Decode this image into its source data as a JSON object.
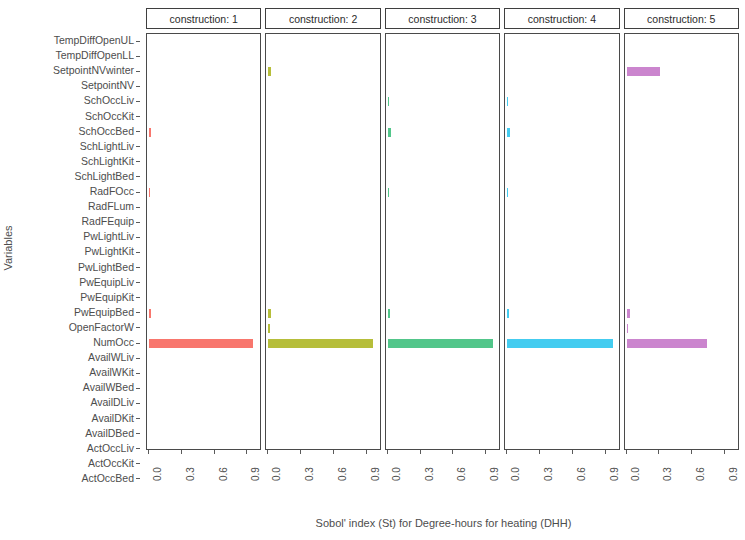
{
  "chart_data": {
    "type": "bar",
    "title": "",
    "xlabel": "Sobol' index (St) for Degree-hours for heating (DHH)",
    "ylabel": "Variables",
    "orientation": "horizontal",
    "facet_variable": "construction",
    "grid": false,
    "legend": "none",
    "xlim": [
      0,
      1.0
    ],
    "xticks": [
      0.0,
      0.3,
      0.6,
      0.9
    ],
    "xticklabels": [
      "0.0",
      "0.3",
      "0.6",
      "0.9"
    ],
    "categories": [
      "TempDiffOpenUL",
      "TempDiffOpenLL",
      "SetpointNVwinter",
      "SetpointNV",
      "SchOccLiv",
      "SchOccKit",
      "SchOccBed",
      "SchLightLiv",
      "SchLightKit",
      "SchLightBed",
      "RadFOcc",
      "RadFLum",
      "RadFEquip",
      "PwLightLiv",
      "PwLightKit",
      "PwLightBed",
      "PwEquipLiv",
      "PwEquipKit",
      "PwEquipBed",
      "OpenFactorW",
      "NumOcc",
      "AvailWLiv",
      "AvailWKit",
      "AvailWBed",
      "AvailDLiv",
      "AvailDKit",
      "AvailDBed",
      "ActOccLiv",
      "ActOccKit",
      "ActOccBed"
    ],
    "panels": [
      {
        "label": "construction: 1",
        "facet_value": "1",
        "color": "#F8766D",
        "values": [
          0,
          0,
          0,
          0,
          0,
          0,
          0.022,
          0,
          0,
          0,
          0.006,
          0,
          0,
          0,
          0,
          0,
          0,
          0,
          0.018,
          0,
          0.95,
          0,
          0,
          0,
          0,
          0,
          0,
          0,
          0,
          0
        ]
      },
      {
        "label": "construction: 2",
        "facet_value": "2",
        "color": "#B6BE3A",
        "values": [
          0,
          0,
          0.026,
          0,
          0,
          0,
          0,
          0,
          0,
          0,
          0,
          0,
          0,
          0,
          0,
          0,
          0,
          0,
          0.022,
          0.008,
          0.955,
          0,
          0,
          0,
          0,
          0,
          0,
          0,
          0,
          0
        ]
      },
      {
        "label": "construction: 3",
        "facet_value": "3",
        "color": "#52C68A",
        "values": [
          0,
          0,
          0,
          0,
          0.008,
          0,
          0.028,
          0,
          0,
          0,
          0.008,
          0,
          0,
          0,
          0,
          0,
          0,
          0,
          0.016,
          0,
          0.965,
          0,
          0,
          0,
          0,
          0,
          0,
          0,
          0,
          0
        ]
      },
      {
        "label": "construction: 4",
        "facet_value": "4",
        "color": "#44CCF0",
        "values": [
          0,
          0,
          0,
          0,
          0.01,
          0,
          0.03,
          0,
          0,
          0,
          0.01,
          0,
          0,
          0,
          0,
          0,
          0,
          0,
          0.016,
          0,
          0.965,
          0,
          0,
          0,
          0,
          0,
          0,
          0,
          0,
          0
        ]
      },
      {
        "label": "construction: 5",
        "facet_value": "5",
        "color": "#CB85CE",
        "values": [
          0,
          0,
          0.305,
          0,
          0,
          0,
          0,
          0,
          0,
          0,
          0,
          0,
          0,
          0,
          0,
          0,
          0,
          0,
          0.03,
          0.015,
          0.735,
          0,
          0,
          0,
          0,
          0,
          0,
          0,
          0,
          0
        ]
      }
    ]
  }
}
